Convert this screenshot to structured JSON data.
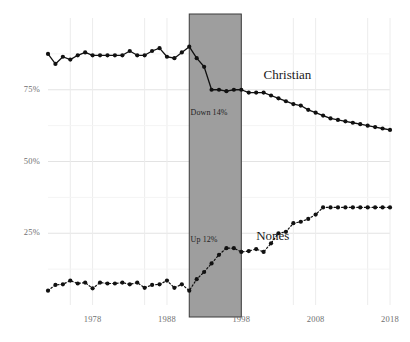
{
  "chart_data": {
    "type": "line",
    "title": "",
    "subtitle": "",
    "xlabel": "",
    "ylabel": "",
    "xlim": [
      1972,
      2018
    ],
    "ylim": [
      0,
      100
    ],
    "grid": true,
    "legend_position": "inline-labels",
    "y_ticks": [
      {
        "value": 75,
        "label": "75%"
      },
      {
        "value": 50,
        "label": "50%"
      },
      {
        "value": 25,
        "label": "25%"
      }
    ],
    "x_ticks": [
      {
        "value": 1978,
        "label": "1978"
      },
      {
        "value": 1988,
        "label": "1988"
      },
      {
        "value": 1998,
        "label": "1998"
      },
      {
        "value": 2008,
        "label": "2008"
      },
      {
        "value": 2018,
        "label": "2018"
      }
    ],
    "highlight_band": {
      "x_start": 1991,
      "x_end": 1998,
      "color": "#9e9e9e"
    },
    "annotations": [
      {
        "name": "down-annotation",
        "text": "Down 14%",
        "x": 1994.0,
        "y": 67
      },
      {
        "name": "up-annotation",
        "text": "Up 12%",
        "x": 1994.0,
        "y": 22.5
      }
    ],
    "series": [
      {
        "name": "Christian",
        "label": "Christian",
        "style": "solid",
        "color": "#111111",
        "label_x": 2001,
        "label_y": 80,
        "x": [
          1972,
          1973,
          1974,
          1975,
          1976,
          1977,
          1978,
          1979,
          1980,
          1981,
          1982,
          1983,
          1984,
          1985,
          1986,
          1987,
          1988,
          1989,
          1990,
          1991,
          1992,
          1993,
          1994,
          1995,
          1996,
          1997,
          1998,
          1999,
          2000,
          2001,
          2002,
          2003,
          2004,
          2005,
          2006,
          2007,
          2008,
          2009,
          2010,
          2011,
          2012,
          2013,
          2014,
          2015,
          2016,
          2017,
          2018
        ],
        "values": [
          87.5,
          84.0,
          86.5,
          85.5,
          87.0,
          88.0,
          87.0,
          87.0,
          87.0,
          87.0,
          87.0,
          88.5,
          87.0,
          87.0,
          88.5,
          89.5,
          86.5,
          86.0,
          88.0,
          90.0,
          86.0,
          83.0,
          75.0,
          75.0,
          74.5,
          75.0,
          75.0,
          74.0,
          74.0,
          74.0,
          73.0,
          72.0,
          71.0,
          70.0,
          69.5,
          68.0,
          67.0,
          66.0,
          65.0,
          64.5,
          64.0,
          63.5,
          63.0,
          62.5,
          62.0,
          61.5,
          61.0
        ]
      },
      {
        "name": "Nones",
        "label": "Nones",
        "style": "dotted",
        "color": "#111111",
        "label_x": 2000,
        "label_y": 24,
        "x": [
          1972,
          1973,
          1974,
          1975,
          1976,
          1977,
          1978,
          1979,
          1980,
          1981,
          1982,
          1983,
          1984,
          1985,
          1986,
          1987,
          1988,
          1989,
          1990,
          1991,
          1992,
          1993,
          1994,
          1995,
          1996,
          1997,
          1998,
          1999,
          2000,
          2001,
          2002,
          2003,
          2004,
          2005,
          2006,
          2007,
          2008,
          2009,
          2010,
          2011,
          2012,
          2013,
          2014,
          2015,
          2016,
          2017,
          2018
        ],
        "values": [
          5.0,
          7.0,
          7.2,
          8.5,
          7.5,
          7.8,
          5.8,
          7.8,
          7.5,
          7.5,
          7.8,
          7.2,
          7.8,
          6.0,
          7.0,
          7.2,
          8.5,
          6.0,
          7.2,
          5.0,
          9.0,
          11.5,
          14.5,
          17.5,
          19.8,
          19.8,
          18.5,
          18.8,
          19.5,
          18.5,
          21.5,
          25.0,
          25.5,
          28.5,
          29.0,
          30.0,
          31.5,
          34.0,
          34.0,
          34.0,
          34.0,
          34.0,
          34.0,
          34.0,
          34.0,
          34.0,
          34.0
        ]
      }
    ]
  }
}
